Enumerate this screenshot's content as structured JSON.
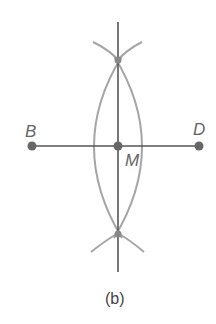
{
  "diagram": {
    "caption": "(b)",
    "points": {
      "B": {
        "label": "B",
        "x": 32,
        "y": 146
      },
      "D": {
        "label": "D",
        "x": 199,
        "y": 146
      },
      "M": {
        "label": "M",
        "x": 118,
        "y": 146
      },
      "top_intersection": {
        "x": 118,
        "y": 60
      },
      "bottom_intersection": {
        "x": 118,
        "y": 234
      }
    },
    "colors": {
      "line": "#555555",
      "arc": "#a0a0a0",
      "point": "#666666",
      "label": "#666666"
    }
  }
}
